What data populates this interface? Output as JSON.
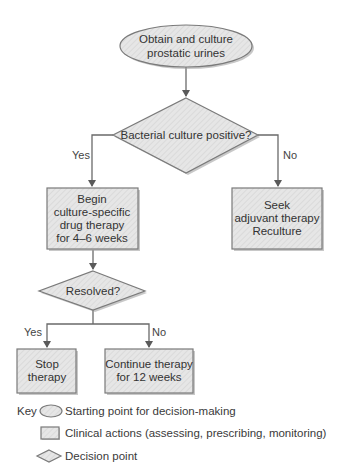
{
  "diagram": {
    "type": "flowchart",
    "colors": {
      "shape_fill": "#e4e4e4",
      "shape_stroke": "#7a7a7a",
      "line": "#6a6a6a",
      "text": "#333333"
    },
    "nodes": {
      "start": {
        "shape": "ellipse",
        "lines": [
          "Obtain and culture",
          "prostatic urines"
        ]
      },
      "decision1": {
        "shape": "diamond",
        "lines": [
          "Bacterial culture positive?"
        ]
      },
      "begin_therapy": {
        "shape": "rectangle",
        "lines": [
          "Begin",
          "culture-specific",
          "drug therapy",
          "for 4–6 weeks"
        ]
      },
      "seek_adjuvant": {
        "shape": "rectangle",
        "lines": [
          "Seek",
          "adjuvant therapy",
          "Reculture"
        ]
      },
      "decision2": {
        "shape": "diamond",
        "lines": [
          "Resolved?"
        ]
      },
      "stop_therapy": {
        "shape": "rectangle",
        "lines": [
          "Stop",
          "therapy"
        ]
      },
      "continue_therapy": {
        "shape": "rectangle",
        "lines": [
          "Continue therapy",
          "for 12 weeks"
        ]
      }
    },
    "edges": [
      {
        "from": "start",
        "to": "decision1",
        "label": ""
      },
      {
        "from": "decision1",
        "to": "begin_therapy",
        "label": "Yes"
      },
      {
        "from": "decision1",
        "to": "seek_adjuvant",
        "label": "No"
      },
      {
        "from": "begin_therapy",
        "to": "decision2",
        "label": ""
      },
      {
        "from": "decision2",
        "to": "stop_therapy",
        "label": "Yes"
      },
      {
        "from": "decision2",
        "to": "continue_therapy",
        "label": "No"
      }
    ],
    "labels": {
      "d1_yes": "Yes",
      "d1_no": "No",
      "d2_yes": "Yes",
      "d2_no": "No"
    },
    "key": {
      "title": "Key",
      "items": [
        {
          "shape": "ellipse",
          "label": "Starting point for decision-making"
        },
        {
          "shape": "rectangle",
          "label": "Clinical actions (assessing, prescribing, monitoring)"
        },
        {
          "shape": "diamond",
          "label": "Decision point"
        }
      ]
    }
  }
}
